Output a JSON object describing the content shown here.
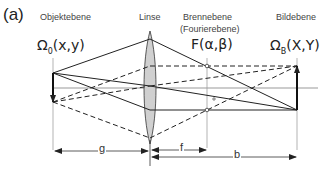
{
  "panel_label": "(a)",
  "planes": {
    "object": {
      "title": "Objektebene",
      "symbol": "Ω",
      "subscript": "0",
      "args": "(x,y)"
    },
    "lens": {
      "title": "Linse"
    },
    "focal": {
      "title": "Brennebene",
      "subtitle": "(Fourierebene)",
      "symbol": "F(α,β)"
    },
    "image": {
      "title": "Bildebene",
      "symbol": "Ω",
      "subscript": "B",
      "args": "(X,Y)"
    }
  },
  "dimensions": {
    "g": "g",
    "f": "f",
    "b": "b"
  },
  "colors": {
    "line": "#222222",
    "axis": "#999999",
    "plane": "#cccccc",
    "lens_fill": "#d0d0d0"
  }
}
